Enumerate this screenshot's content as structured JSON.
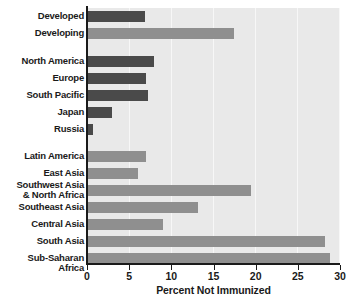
{
  "chart_data": {
    "type": "bar",
    "orientation": "horizontal",
    "title": "",
    "xlabel": "Percent Not Immunized",
    "ylabel": "",
    "xlim": [
      0,
      30
    ],
    "xticks": [
      0,
      5,
      10,
      15,
      20,
      25,
      30
    ],
    "grid": true,
    "legend_position": "none",
    "categories": [
      "Developed",
      "Developing",
      "North America",
      "Europe",
      "South Pacific",
      "Japan",
      "Russia",
      "Latin America",
      "East Asia",
      "Southwest Asia\n& North Africa",
      "Southeast Asia",
      "Central Asia",
      "South Asia",
      "Sub-Saharan Africa"
    ],
    "values": [
      6.9,
      17.4,
      8.0,
      7.0,
      7.2,
      3.0,
      0.7,
      7.0,
      6.0,
      19.4,
      13.2,
      9.0,
      28.2,
      28.8
    ],
    "series": [
      {
        "name": "Percent Not Immunized",
        "values": [
          6.9,
          17.4,
          8.0,
          7.0,
          7.2,
          3.0,
          0.7,
          7.0,
          6.0,
          19.4,
          13.2,
          9.0,
          28.2,
          28.8
        ]
      }
    ],
    "bar_colors": [
      "#4a4a4a",
      "#8f8f8f",
      "#4a4a4a",
      "#4a4a4a",
      "#4a4a4a",
      "#4a4a4a",
      "#4a4a4a",
      "#8f8f8f",
      "#8f8f8f",
      "#8f8f8f",
      "#8f8f8f",
      "#8f8f8f",
      "#8f8f8f",
      "#8f8f8f"
    ],
    "group_breaks_after": [
      "Developing",
      "Russia"
    ],
    "colors": {
      "developed_bar": "#4a4a4a",
      "developing_bar": "#8f8f8f",
      "plot_background": "#e9e9e9",
      "gridline": "#f7f7f7",
      "axis": "#1a1a1a",
      "text": "#1a1a1a",
      "page_background": "#ffffff"
    }
  }
}
